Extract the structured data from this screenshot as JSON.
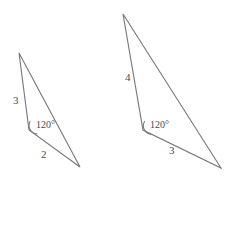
{
  "figure": {
    "type": "geometry-diagram",
    "background_color": "#ffffff",
    "stroke_color": "#7a7a7a",
    "text_color": "#4a4a4a",
    "canvas": {
      "width": 247,
      "height": 226
    },
    "shapes": [
      {
        "name": "left-triangle",
        "vertices": [
          {
            "name": "apex",
            "x": 19,
            "y": 53
          },
          {
            "name": "angle-vertex",
            "x": 29,
            "y": 130
          },
          {
            "name": "base-right",
            "x": 80,
            "y": 167
          }
        ],
        "labels": {
          "side_a": "3",
          "side_b": "2",
          "angle": "120°"
        }
      },
      {
        "name": "right-triangle",
        "vertices": [
          {
            "name": "apex",
            "x": 123,
            "y": 14
          },
          {
            "name": "angle-vertex",
            "x": 143,
            "y": 130
          },
          {
            "name": "base-right",
            "x": 221,
            "y": 168
          }
        ],
        "labels": {
          "side_a": "4",
          "side_b": "3",
          "angle": "120°"
        }
      }
    ],
    "label_positions": {
      "left_side_a": {
        "x": 13,
        "y": 95
      },
      "left_angle": {
        "x": 36,
        "y": 120
      },
      "left_side_b": {
        "x": 41,
        "y": 149
      },
      "right_side_a": {
        "x": 125,
        "y": 72
      },
      "right_angle": {
        "x": 150,
        "y": 120
      },
      "right_side_b": {
        "x": 169,
        "y": 145
      }
    }
  }
}
